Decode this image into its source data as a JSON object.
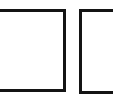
{
  "image": {
    "width": 113,
    "height": 103,
    "background_color": "#ffffff",
    "description": "Two empty square outlines side by side on a plain white background",
    "alt_text": "Two empty square boxes"
  },
  "palette": {
    "stroke_color": "#141414",
    "fill_color": "#ffffff",
    "page_color": "#ffffff"
  },
  "boxes": [
    {
      "id": "box-left",
      "label": "",
      "value": "",
      "state": "unchecked",
      "stroke_color": "#141414",
      "fill_color": "#ffffff",
      "stroke_width_px": 3,
      "x": -4,
      "y": 9,
      "width": 70,
      "height": 83,
      "clipped_edge": "left"
    },
    {
      "id": "box-right",
      "label": "",
      "value": "",
      "state": "unchecked",
      "stroke_color": "#141414",
      "fill_color": "#ffffff",
      "stroke_width_px": 3,
      "x": 79,
      "y": 9,
      "width": 40,
      "height": 85,
      "clipped_edge": "right"
    }
  ]
}
